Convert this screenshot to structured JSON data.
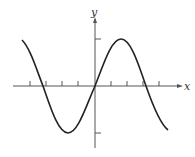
{
  "figure": {
    "type": "function-graph",
    "axes": {
      "x_label": "x",
      "y_label": "y"
    },
    "colors": {
      "curve": "#222222",
      "axis": "#555555",
      "background": "#ffffff"
    },
    "x_ticks_count": 8,
    "y_ticks_count": 2
  }
}
